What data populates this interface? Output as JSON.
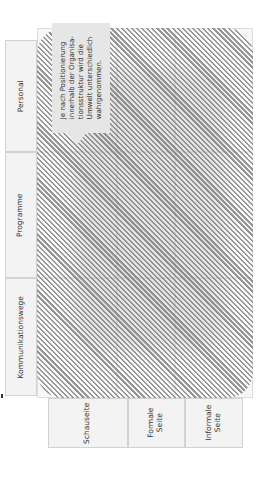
{
  "diagram": {
    "orientation": "rotated-90-ccw",
    "columns": [
      {
        "label": "Personal"
      },
      {
        "label": "Programme"
      },
      {
        "label": "Kommunikationswege"
      }
    ],
    "rows": [
      {
        "label": "Schauseite"
      },
      {
        "label": "Formale\nSeite"
      },
      {
        "label": "Informale\nSeite"
      }
    ],
    "callout": {
      "lines": [
        "Je nach Positionierung",
        "innerhalb der Organisa-",
        "tionsstruktur wird die",
        "Umwelt unterschiedlich",
        "wahrgenommen."
      ]
    },
    "colors": {
      "hatch": "#8c8c8c",
      "cell_background": "#f3f3f3",
      "cell_border": "#d2d2d2",
      "callout_background": "#e6e6e6"
    }
  }
}
